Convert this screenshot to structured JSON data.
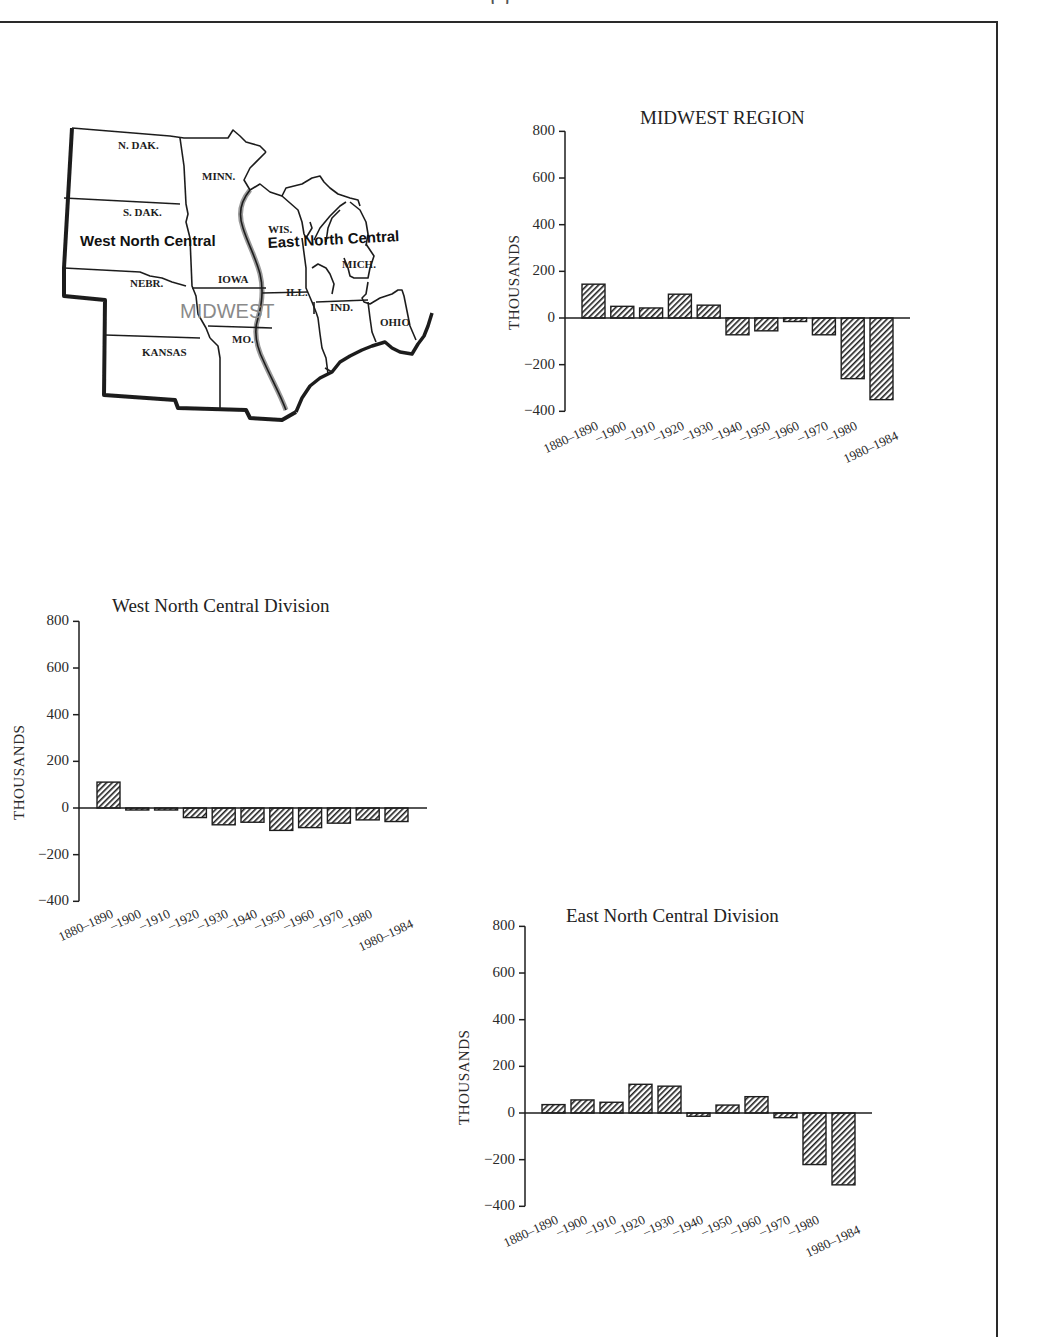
{
  "page": {
    "header_fragment": "(           )"
  },
  "map": {
    "region_label": "MIDWEST",
    "division_labels": [
      "West North Central",
      "East North Central"
    ],
    "states": [
      "N. DAK.",
      "S. DAK.",
      "NEBR.",
      "KANSAS",
      "MINN.",
      "IOWA",
      "MO.",
      "WIS.",
      "ILL.",
      "MICH.",
      "IND.",
      "OHIO"
    ]
  },
  "chart_data": [
    {
      "type": "bar",
      "title": "MIDWEST REGION",
      "xlabel": "",
      "ylabel": "THOUSANDS",
      "ylim": [
        -400,
        800
      ],
      "yticks": [
        800,
        600,
        400,
        200,
        0,
        -200,
        -400
      ],
      "yticks_labels": [
        "800",
        "600",
        "400",
        "200",
        "0",
        "−200",
        "−400"
      ],
      "grid": false,
      "legend": null,
      "categories": [
        "1880–1890",
        "–1900",
        "–1910",
        "–1920",
        "–1930",
        "–1940",
        "–1950",
        "–1960",
        "–1970",
        "–1980",
        "1980–1984"
      ],
      "values": [
        145,
        50,
        43,
        102,
        55,
        -72,
        -55,
        -15,
        -72,
        -260,
        -350
      ],
      "bar_fill": "diagonal-hatch"
    },
    {
      "type": "bar",
      "title": "West North Central Division",
      "xlabel": "",
      "ylabel": "THOUSANDS",
      "ylim": [
        -400,
        800
      ],
      "yticks": [
        800,
        600,
        400,
        200,
        0,
        -200,
        -400
      ],
      "yticks_labels": [
        "800",
        "600",
        "400",
        "200",
        "0",
        "−200",
        "−400"
      ],
      "grid": false,
      "legend": null,
      "categories": [
        "1880–1890",
        "–1900",
        "–1910",
        "–1920",
        "–1930",
        "–1940",
        "–1950",
        "–1960",
        "–1970",
        "–1980",
        "1980–1984"
      ],
      "values": [
        111,
        -8,
        -8,
        -41,
        -72,
        -61,
        -96,
        -84,
        -65,
        -51,
        -58
      ],
      "bar_fill": "diagonal-hatch"
    },
    {
      "type": "bar",
      "title": "East North Central Division",
      "xlabel": "",
      "ylabel": "THOUSANDS",
      "ylim": [
        -400,
        800
      ],
      "yticks": [
        800,
        600,
        400,
        200,
        0,
        -200,
        -400
      ],
      "yticks_labels": [
        "800",
        "600",
        "400",
        "200",
        "0",
        "−200",
        "−400"
      ],
      "grid": false,
      "legend": null,
      "categories": [
        "1880–1890",
        "–1900",
        "–1910",
        "–1920",
        "–1930",
        "–1940",
        "–1950",
        "–1960",
        "–1970",
        "–1980",
        "1980–1984"
      ],
      "values": [
        36,
        56,
        46,
        123,
        115,
        -14,
        34,
        70,
        -20,
        -221,
        -308
      ],
      "bar_fill": "diagonal-hatch"
    }
  ],
  "colors": {
    "ink": "#1e1e1e",
    "river_shade": "#9a9a9a",
    "midwest_label": "#8a8a8a",
    "background": "#ffffff"
  }
}
